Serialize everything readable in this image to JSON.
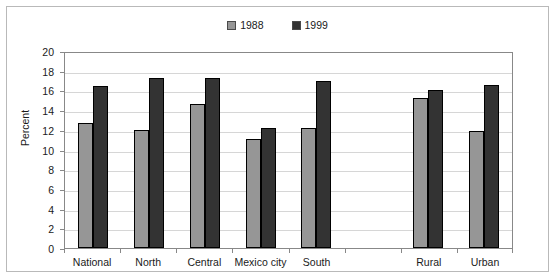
{
  "chart_data": {
    "type": "bar",
    "title": "",
    "subtitle": "",
    "xlabel": "",
    "ylabel": "Percent",
    "ylim": [
      0,
      20
    ],
    "ytick_step": 2,
    "yticks": [
      "20",
      "18",
      "16",
      "14",
      "12",
      "10",
      "8",
      "6",
      "4",
      "2",
      "0"
    ],
    "grid": true,
    "legend_position": "top-center",
    "categories": [
      "National",
      "North",
      "Central",
      "Mexico city",
      "South",
      "",
      "Rural",
      "Urban"
    ],
    "series": [
      {
        "name": "1988",
        "color": "#969696",
        "values": [
          12.7,
          12.0,
          14.6,
          11.1,
          12.2,
          null,
          15.2,
          11.9
        ]
      },
      {
        "name": "1999",
        "color": "#333333",
        "values": [
          16.4,
          17.3,
          17.3,
          12.2,
          17.0,
          null,
          16.0,
          16.6
        ]
      }
    ]
  },
  "legend": {
    "entries": [
      {
        "label": "1988",
        "color": "#969696"
      },
      {
        "label": "1999",
        "color": "#333333"
      }
    ]
  },
  "colors": {
    "series_1988": "#969696",
    "series_1999": "#333333",
    "axis": "#888888",
    "gridline": "#d6d6d6",
    "frame_border": "#b9b9b9",
    "text": "#1a1a1a",
    "background": "#ffffff"
  }
}
